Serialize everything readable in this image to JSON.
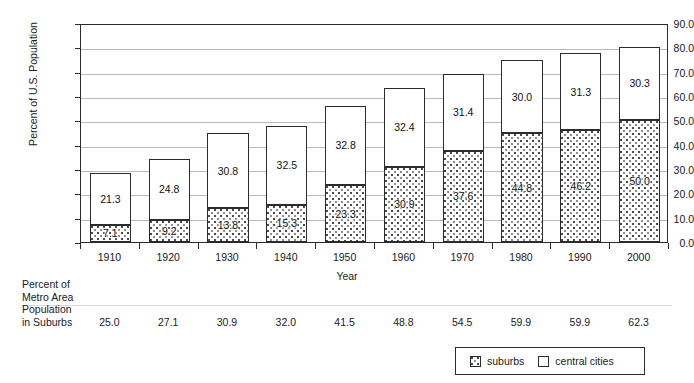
{
  "chart_data": {
    "type": "bar",
    "subtype": "stacked",
    "title": "",
    "xlabel": "Year",
    "ylabel": "Percent of U.S. Population",
    "ylim": [
      0,
      90
    ],
    "ytick_step": 10,
    "ytick_labels": [
      "0.0",
      "10.0",
      "20.0",
      "30.0",
      "40.0",
      "50.0",
      "60.0",
      "70.0",
      "80.0",
      "90.0"
    ],
    "grid": true,
    "legend_position": "bottom-right",
    "categories": [
      "1910",
      "1920",
      "1930",
      "1940",
      "1950",
      "1960",
      "1970",
      "1980",
      "1990",
      "2000"
    ],
    "series": [
      {
        "name": "suburbs",
        "pattern": "dotted",
        "values": [
          7.1,
          9.2,
          13.8,
          15.3,
          23.3,
          30.9,
          37.6,
          44.8,
          46.2,
          50.0
        ],
        "labels": [
          "7.1",
          "9.2",
          "13.8",
          "15.3",
          "23.3",
          "30.9",
          "37.6",
          "44.8",
          "46.2",
          "50.0"
        ]
      },
      {
        "name": "central cities",
        "pattern": "solid-white",
        "values": [
          21.3,
          24.8,
          30.8,
          32.5,
          32.8,
          32.4,
          31.4,
          30.0,
          31.3,
          30.3
        ],
        "labels": [
          "21.3",
          "24.8",
          "30.8",
          "32.5",
          "32.8",
          "32.4",
          "31.4",
          "30.0",
          "31.3",
          "30.3"
        ]
      }
    ],
    "totals": [
      28.4,
      34.0,
      44.6,
      47.8,
      56.1,
      63.3,
      69.0,
      74.8,
      77.5,
      80.3
    ],
    "annotation_row": {
      "label_lines": [
        "Percent of",
        "Metro Area",
        "Population",
        "in Suburbs"
      ],
      "values": [
        "25.0",
        "27.1",
        "30.9",
        "32.0",
        "41.5",
        "48.8",
        "54.5",
        "59.9",
        "59.9",
        "62.3"
      ]
    }
  },
  "legend": {
    "items": [
      {
        "label": "suburbs",
        "swatch": "dotted-swatch-icon"
      },
      {
        "label": "central cities",
        "swatch": "white-swatch-icon"
      }
    ]
  },
  "colors": {
    "axis": "#2b2b2b",
    "gridline": "#b9b9b9",
    "text": "#1a1a1a",
    "bar_fill_central": "#ffffff",
    "bar_pattern_suburbs": "#4a4a4a"
  }
}
